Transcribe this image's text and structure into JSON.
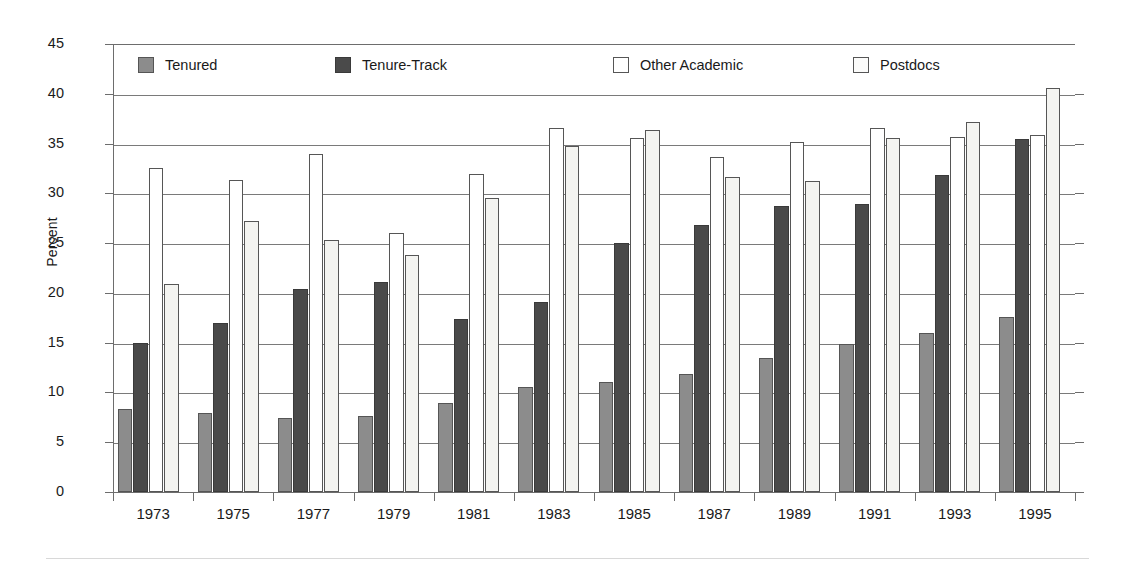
{
  "chart_data": {
    "type": "bar",
    "title": "",
    "xlabel": "",
    "ylabel": "Percent",
    "ylim": [
      0,
      45
    ],
    "yticks": [
      0,
      5,
      10,
      15,
      20,
      25,
      30,
      35,
      40,
      45
    ],
    "grid": true,
    "legend_position": "top-inside",
    "categories": [
      "1973",
      "1975",
      "1977",
      "1979",
      "1981",
      "1983",
      "1985",
      "1987",
      "1989",
      "1991",
      "1993",
      "1995"
    ],
    "series": [
      {
        "name": "Tenured",
        "color": "#8c8c8c",
        "values": [
          8.3,
          7.9,
          7.4,
          7.6,
          8.9,
          10.5,
          11.1,
          11.9,
          13.5,
          14.9,
          16.0,
          17.6
        ]
      },
      {
        "name": "Tenure-Track",
        "color": "#4a4a4a",
        "values": [
          15.0,
          17.0,
          20.4,
          21.1,
          17.4,
          19.1,
          25.0,
          26.8,
          28.7,
          28.9,
          31.8,
          35.5
        ]
      },
      {
        "name": "Other Academic",
        "color": "#ffffff",
        "values": [
          32.5,
          31.3,
          34.0,
          26.0,
          31.9,
          36.6,
          35.6,
          33.7,
          35.2,
          36.6,
          35.7,
          35.9
        ]
      },
      {
        "name": "Postdocs",
        "color": "#f4f4f1",
        "values": [
          20.9,
          27.2,
          25.3,
          23.8,
          29.5,
          34.8,
          36.4,
          31.6,
          31.2,
          35.6,
          37.2,
          40.6
        ]
      }
    ]
  },
  "axes": {
    "y_title": "Percent"
  }
}
